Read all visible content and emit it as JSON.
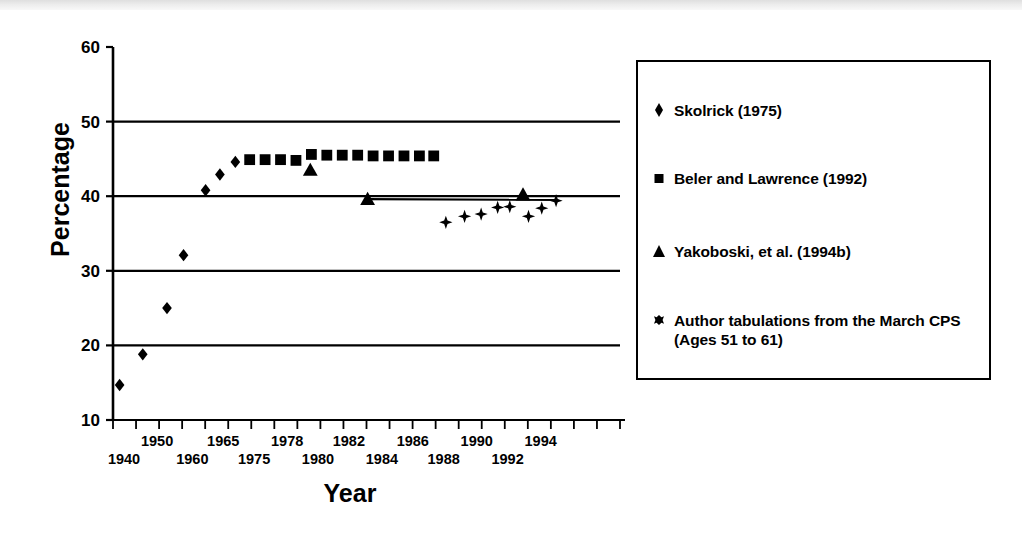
{
  "figure": {
    "y_axis_title": "Percentage",
    "x_axis_title": "Year"
  },
  "legend": {
    "items": [
      {
        "marker": "diamond-marker",
        "label": "Skolrick (1975)"
      },
      {
        "marker": "square-marker",
        "label": "Beler and Lawrence (1992)"
      },
      {
        "marker": "triangle-marker",
        "label": "Yakoboski, et al. (1994b)"
      },
      {
        "marker": "star-marker",
        "label": "Author tabulations from the March CPS\n(Ages 51 to 61)"
      }
    ]
  },
  "chart_data": {
    "type": "scatter",
    "title": "",
    "xlabel": "Year",
    "ylabel": "Percentage",
    "ylim": [
      10,
      60
    ],
    "yticks": [
      10,
      20,
      30,
      40,
      50,
      60
    ],
    "gridlines": [
      20,
      30,
      40,
      50
    ],
    "grid": true,
    "legend_position": "right",
    "xlim": [
      0,
      23
    ],
    "x_tick_labels": [
      "1940",
      "1950",
      "1960",
      "1965",
      "1975",
      "1978",
      "1980",
      "1982",
      "1984",
      "1986",
      "1988",
      "1990",
      "1992",
      "1994"
    ],
    "x_tick_label_rows": [
      1,
      0,
      1,
      0,
      1,
      0,
      1,
      0,
      1,
      0,
      1,
      0,
      1,
      0
    ],
    "x_tick_label_slots": [
      0.5,
      2.0,
      3.6,
      5.0,
      6.4,
      7.9,
      9.3,
      10.7,
      12.2,
      13.6,
      15.0,
      16.5,
      17.9,
      19.4
    ],
    "minor_tick_count": 22,
    "series": [
      {
        "name": "Skolrick (1975)",
        "marker": "diamond",
        "points": [
          {
            "slot": 0.3,
            "value": 14.7
          },
          {
            "slot": 1.35,
            "value": 18.8
          },
          {
            "slot": 2.45,
            "value": 25.0
          },
          {
            "slot": 3.2,
            "value": 32.1
          },
          {
            "slot": 4.2,
            "value": 40.8
          },
          {
            "slot": 4.85,
            "value": 42.9
          },
          {
            "slot": 5.55,
            "value": 44.6
          }
        ]
      },
      {
        "name": "Beler and Lawrence (1992)",
        "marker": "square",
        "points": [
          {
            "slot": 6.2,
            "value": 44.9
          },
          {
            "slot": 6.9,
            "value": 44.9
          },
          {
            "slot": 7.6,
            "value": 44.9
          },
          {
            "slot": 8.3,
            "value": 44.8
          },
          {
            "slot": 9.0,
            "value": 45.6
          },
          {
            "slot": 9.7,
            "value": 45.5
          },
          {
            "slot": 10.4,
            "value": 45.5
          },
          {
            "slot": 11.1,
            "value": 45.5
          },
          {
            "slot": 11.8,
            "value": 45.4
          },
          {
            "slot": 12.5,
            "value": 45.4
          },
          {
            "slot": 13.2,
            "value": 45.4
          },
          {
            "slot": 13.9,
            "value": 45.4
          },
          {
            "slot": 14.55,
            "value": 45.4
          }
        ]
      },
      {
        "name": "Yakoboski, et al. (1994b)",
        "marker": "triangle",
        "points": [
          {
            "slot": 8.95,
            "value": 43.5
          },
          {
            "slot": 11.55,
            "value": 39.6
          },
          {
            "slot": 18.6,
            "value": 40.2
          }
        ]
      },
      {
        "name": "Author tabulations from the March CPS (Ages 51 to 61)",
        "marker": "star",
        "points": [
          {
            "slot": 15.1,
            "value": 36.5
          },
          {
            "slot": 15.95,
            "value": 37.3
          },
          {
            "slot": 16.7,
            "value": 37.6
          },
          {
            "slot": 17.45,
            "value": 38.5
          },
          {
            "slot": 18.0,
            "value": 38.6
          },
          {
            "slot": 18.85,
            "value": 37.3
          },
          {
            "slot": 19.45,
            "value": 38.4
          },
          {
            "slot": 20.1,
            "value": 39.4
          }
        ]
      }
    ],
    "trend_line": {
      "from_slot": 11.55,
      "to_slot": 20.2,
      "from_value": 39.6,
      "to_value": 39.5
    }
  }
}
